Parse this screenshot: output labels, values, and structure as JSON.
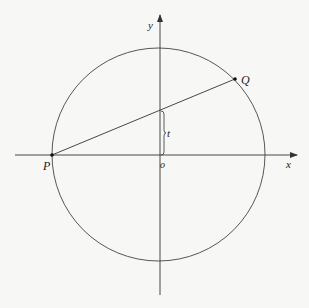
{
  "diagram": {
    "type": "geometry",
    "colors": {
      "stroke": "#333333",
      "background": "#f7f7f5",
      "text": "#222222"
    },
    "axes": {
      "x_label": "x",
      "y_label": "y",
      "origin_label": "o"
    },
    "points": {
      "P": {
        "label": "P"
      },
      "Q": {
        "label": "Q"
      }
    },
    "segment_label": "t"
  }
}
